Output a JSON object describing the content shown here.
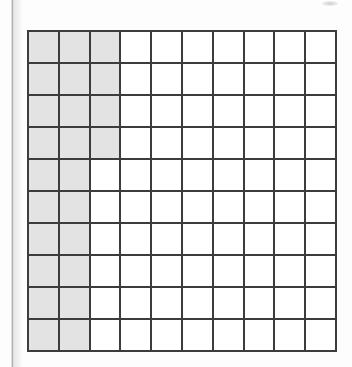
{
  "document": {
    "type": "worksheet-figure",
    "figure_name": "hundred-square-grid"
  },
  "grid": {
    "rows": 10,
    "columns": 10,
    "total_cells": 100,
    "shaded_count": 24,
    "unshaded_count": 76,
    "shaded_per_row": [
      3,
      3,
      3,
      3,
      2,
      2,
      2,
      2,
      2,
      2
    ],
    "shaded_cells": [
      [
        true,
        true,
        true,
        false,
        false,
        false,
        false,
        false,
        false,
        false
      ],
      [
        true,
        true,
        true,
        false,
        false,
        false,
        false,
        false,
        false,
        false
      ],
      [
        true,
        true,
        true,
        false,
        false,
        false,
        false,
        false,
        false,
        false
      ],
      [
        true,
        true,
        true,
        false,
        false,
        false,
        false,
        false,
        false,
        false
      ],
      [
        true,
        true,
        false,
        false,
        false,
        false,
        false,
        false,
        false,
        false
      ],
      [
        true,
        true,
        false,
        false,
        false,
        false,
        false,
        false,
        false,
        false
      ],
      [
        true,
        true,
        false,
        false,
        false,
        false,
        false,
        false,
        false,
        false
      ],
      [
        true,
        true,
        false,
        false,
        false,
        false,
        false,
        false,
        false,
        false
      ],
      [
        true,
        true,
        false,
        false,
        false,
        false,
        false,
        false,
        false,
        false
      ],
      [
        true,
        true,
        false,
        false,
        false,
        false,
        false,
        false,
        false,
        false
      ]
    ]
  },
  "colors": {
    "shaded_fill": "#e3e3e3",
    "unshaded_fill": "#ffffff",
    "grid_line": "#3c3c3c",
    "page_background": "#fdfdfd",
    "page_edge_line": "#b9b9b9"
  },
  "scan_artifacts": {
    "page_edge_label": "page-edge-line",
    "smudge_label": "scan-smudge"
  }
}
